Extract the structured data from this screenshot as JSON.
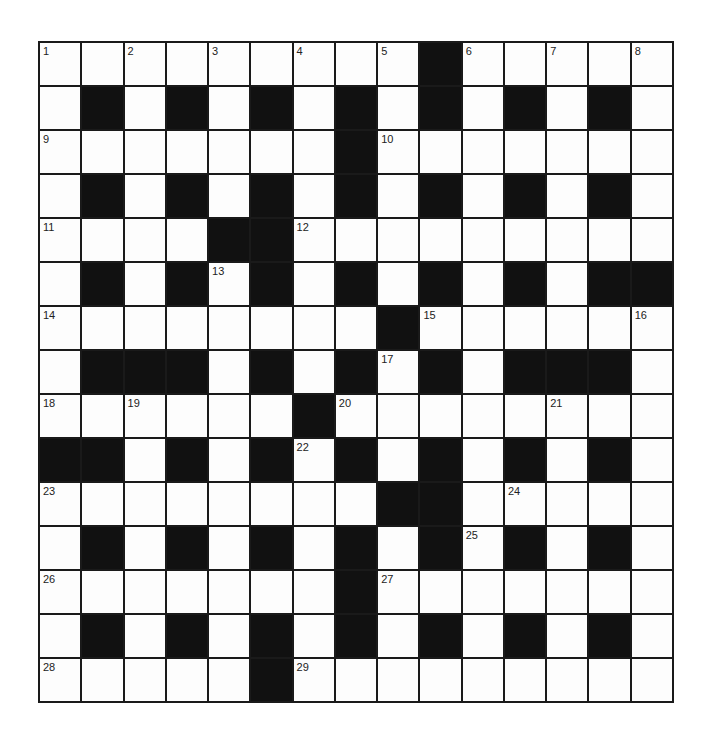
{
  "puzzle": {
    "size": 15,
    "rows": [
      ".........#.....",
      ".#.#.#.#.#.#.#.",
      ".......#.......",
      ".#.#.#.#.#.#.#.",
      "....##.........",
      ".#.#.#.#.#.#.##",
      "........#......",
      ".###.#.#.#.###.",
      "......#........",
      "##.#.#.#.#.#.#.",
      "........##.....",
      ".#.#.#.#.#.#.#.",
      ".......#.......",
      ".#.#.#.#.#.#.#.",
      ".....#........."
    ],
    "numbers": [
      {
        "row": 0,
        "col": 0,
        "n": "1"
      },
      {
        "row": 0,
        "col": 2,
        "n": "2"
      },
      {
        "row": 0,
        "col": 4,
        "n": "3"
      },
      {
        "row": 0,
        "col": 6,
        "n": "4"
      },
      {
        "row": 0,
        "col": 8,
        "n": "5"
      },
      {
        "row": 0,
        "col": 10,
        "n": "6"
      },
      {
        "row": 0,
        "col": 12,
        "n": "7"
      },
      {
        "row": 0,
        "col": 14,
        "n": "8"
      },
      {
        "row": 2,
        "col": 0,
        "n": "9"
      },
      {
        "row": 2,
        "col": 8,
        "n": "10"
      },
      {
        "row": 4,
        "col": 0,
        "n": "11"
      },
      {
        "row": 4,
        "col": 6,
        "n": "12"
      },
      {
        "row": 5,
        "col": 4,
        "n": "13"
      },
      {
        "row": 6,
        "col": 0,
        "n": "14"
      },
      {
        "row": 6,
        "col": 9,
        "n": "15"
      },
      {
        "row": 6,
        "col": 14,
        "n": "16"
      },
      {
        "row": 7,
        "col": 8,
        "n": "17"
      },
      {
        "row": 8,
        "col": 0,
        "n": "18"
      },
      {
        "row": 8,
        "col": 2,
        "n": "19"
      },
      {
        "row": 8,
        "col": 7,
        "n": "20"
      },
      {
        "row": 8,
        "col": 12,
        "n": "21"
      },
      {
        "row": 9,
        "col": 6,
        "n": "22"
      },
      {
        "row": 10,
        "col": 0,
        "n": "23"
      },
      {
        "row": 10,
        "col": 11,
        "n": "24"
      },
      {
        "row": 11,
        "col": 10,
        "n": "25"
      },
      {
        "row": 12,
        "col": 0,
        "n": "26"
      },
      {
        "row": 12,
        "col": 8,
        "n": "27"
      },
      {
        "row": 14,
        "col": 0,
        "n": "28"
      },
      {
        "row": 14,
        "col": 6,
        "n": "29"
      }
    ],
    "colors": {
      "block": "#111111",
      "cell": "#fdfdfd",
      "line": "#1a1a1a"
    }
  }
}
